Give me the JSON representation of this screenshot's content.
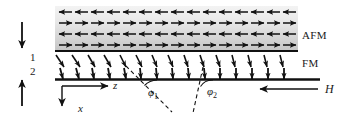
{
  "figure": {
    "background_color": "#ffffff",
    "ink_color": "#111111"
  },
  "layers": {
    "afm": {
      "label": "AFM",
      "label_x": 302,
      "label_y": 30,
      "band_x": 55,
      "band_y": 6,
      "band_width": 243,
      "band_height": 44,
      "fill_top_color": "#efefef",
      "fill_bottom_color": "#c9c9c9",
      "rows": 4,
      "columns": 15,
      "row_directions": [
        "left",
        "right",
        "left",
        "right"
      ],
      "arrow_color": "#111111",
      "description": "Antiferromagnet: four stacked rows of alternating in-plane spins"
    },
    "fm": {
      "label": "FM",
      "label_x": 302,
      "label_y": 58,
      "region_x": 55,
      "region_y": 52,
      "region_width": 243,
      "region_height": 30,
      "rows": 2,
      "columns": 15,
      "arrow_color": "#111111",
      "row_tilt_degrees_top": [
        52,
        54,
        57,
        60,
        63,
        66,
        69,
        72,
        74,
        76,
        78,
        80,
        81,
        82,
        83
      ],
      "row_tilt_degrees_bottom": [
        76,
        78,
        80,
        82,
        84,
        85,
        86,
        87,
        88,
        88,
        89,
        89,
        89,
        90,
        90
      ],
      "description": "Ferromagnet: two rows of spins whose canting angle relaxes with depth and position"
    }
  },
  "interfaces": {
    "afm_fm_line": {
      "x1": 55,
      "y1": 51,
      "x2": 298,
      "y2": 51,
      "stroke_width": 2
    },
    "fm_bottom_line": {
      "x1": 55,
      "y1": 79,
      "x2": 320,
      "y2": 79,
      "stroke_width": 2.4
    }
  },
  "markers": {
    "layer_index_1": {
      "label": "1",
      "x": 30,
      "y": 52
    },
    "layer_index_2": {
      "label": "2",
      "x": 30,
      "y": 66
    },
    "top_arrow": {
      "name": "thickness-arrow-down",
      "x": 22,
      "y_start": 22,
      "y_end": 48,
      "direction": "down"
    },
    "bottom_arrow": {
      "name": "thickness-arrow-up",
      "x": 22,
      "y_start": 104,
      "y_end": 78,
      "direction": "up"
    }
  },
  "axes": {
    "origin_x": 62,
    "origin_y": 86,
    "z_axis": {
      "label": "z",
      "direction": "right",
      "x_start": 62,
      "y_start": 86,
      "x_end": 110,
      "y_end": 86
    },
    "x_axis": {
      "label": "x",
      "direction": "down",
      "x_start": 62,
      "y_start": 86,
      "x_end": 62,
      "y_end": 108
    }
  },
  "angles": [
    {
      "name": "phi-1",
      "label": "φ",
      "subscript": "1",
      "label_x": 148,
      "label_y": 87,
      "vertex_x": 139,
      "vertex_y": 80,
      "dash_x1": 126,
      "dash_y1": 66,
      "dash_x2": 172,
      "dash_y2": 112,
      "arc_radius": 18,
      "value_degrees": 45,
      "line_style": "dashed"
    },
    {
      "name": "phi-2",
      "label": "φ",
      "subscript": "2",
      "label_x": 207,
      "label_y": 86,
      "vertex_x": 199,
      "vertex_y": 80,
      "dash_x1": 203,
      "dash_y1": 67,
      "dash_x2": 193,
      "dash_y2": 113,
      "arc_radius": 14,
      "value_degrees": 78,
      "line_style": "dashed"
    }
  ],
  "field": {
    "label": "H",
    "label_x": 325,
    "label_y": 83,
    "arrow_x_tail": 318,
    "arrow_x_head": 258,
    "arrow_y": 89,
    "direction": "left",
    "description": "Applied magnetic field H pointing along -z"
  }
}
